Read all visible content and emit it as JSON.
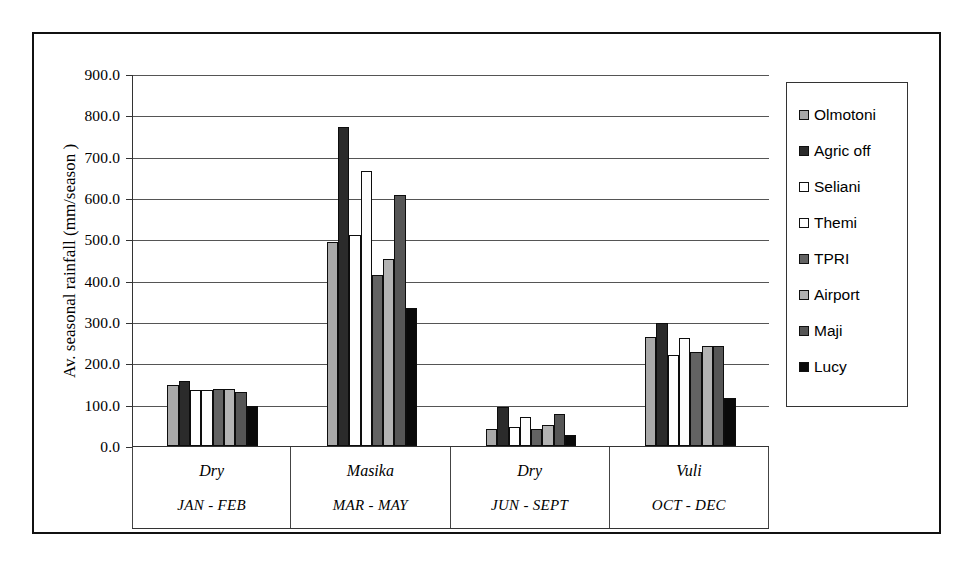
{
  "chart_data": {
    "type": "bar",
    "title": "",
    "xlabel": "",
    "ylabel": "Av. seasonal rainfall (mm/season )",
    "ylim": [
      0,
      900
    ],
    "ytick_step": 100,
    "ytick_labels": [
      "900.0",
      "800.0",
      "700.0",
      "600.0",
      "500.0",
      "400.0",
      "300.0",
      "200.0",
      "100.0",
      "0.0"
    ],
    "grid": true,
    "legend_position": "right",
    "categories": [
      {
        "season": "Dry",
        "months": "JAN - FEB"
      },
      {
        "season": "Masika",
        "months": "MAR - MAY"
      },
      {
        "season": "Dry",
        "months": "JUN - SEPT"
      },
      {
        "season": "Vuli",
        "months": "OCT - DEC"
      }
    ],
    "series": [
      {
        "name": "Olmotoni",
        "color": "#a9a9a9",
        "values": [
          148,
          493,
          42,
          264
        ]
      },
      {
        "name": "Agric off",
        "color": "#2b2b2b",
        "values": [
          158,
          772,
          95,
          297
        ]
      },
      {
        "name": "Seliani",
        "color": "#ffffff",
        "values": [
          135,
          511,
          45,
          221
        ]
      },
      {
        "name": "Themi",
        "color": "#fdfdfd",
        "values": [
          135,
          665,
          71,
          261
        ]
      },
      {
        "name": "TPRI",
        "color": "#636363",
        "values": [
          139,
          413,
          42,
          228
        ]
      },
      {
        "name": "Airport",
        "color": "#b3b3b3",
        "values": [
          138,
          453,
          52,
          243
        ]
      },
      {
        "name": "Maji",
        "color": "#565656",
        "values": [
          130,
          607,
          78,
          243
        ]
      },
      {
        "name": "Lucy",
        "color": "#0a0a0a",
        "values": [
          97,
          335,
          27,
          116
        ]
      }
    ]
  }
}
